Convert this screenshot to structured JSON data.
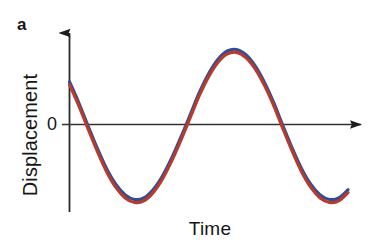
{
  "figure": {
    "panel_label": "a",
    "background_color": "#ffffff",
    "width": 381,
    "height": 248
  },
  "chart_data": {
    "type": "line",
    "title": "",
    "subtitle": "",
    "xlabel": "Time",
    "ylabel": "Displacement",
    "grid": false,
    "legend": null,
    "axes": {
      "x_axis": {
        "label": "Time",
        "tick_labels": [],
        "arrow": true,
        "zero_line": true,
        "color": "#303030"
      },
      "y_axis": {
        "label": "Displacement",
        "tick_labels": [
          "0"
        ],
        "tick_values": [
          0
        ],
        "arrow": true,
        "color": "#303030"
      }
    },
    "xlim": [
      0,
      1.52
    ],
    "ylim": [
      -1.15,
      1.15
    ],
    "annotations": [
      {
        "text": "a",
        "role": "panel-label"
      },
      {
        "text": "0",
        "role": "y-axis-zero-tick"
      }
    ],
    "series": [
      {
        "name": "wave-blue",
        "color": "#2d4f97",
        "line_width": 3.2,
        "amplitude": 1.0,
        "period": 1.0,
        "phase_deg": 145,
        "x": [
          0.0,
          0.05,
          0.1,
          0.15,
          0.2,
          0.25,
          0.3,
          0.35,
          0.4,
          0.45,
          0.5,
          0.55,
          0.6,
          0.65,
          0.7,
          0.75,
          0.8,
          0.85,
          0.9,
          0.95,
          1.0,
          1.05,
          1.1,
          1.15,
          1.2,
          1.25,
          1.3,
          1.35,
          1.4,
          1.45,
          1.5
        ],
        "values": [
          0.57,
          0.29,
          -0.02,
          -0.32,
          -0.59,
          -0.8,
          -0.94,
          -1.0,
          -0.98,
          -0.87,
          -0.69,
          -0.45,
          -0.17,
          0.13,
          0.43,
          0.68,
          0.87,
          0.98,
          1.0,
          0.93,
          0.78,
          0.56,
          0.29,
          -0.02,
          -0.32,
          -0.59,
          -0.8,
          -0.94,
          -1.0,
          -0.98,
          -0.87
        ]
      },
      {
        "name": "wave-red",
        "color": "#b73a2c",
        "line_width": 3.2,
        "amplitude": 1.0,
        "period": 1.0,
        "phase_deg": 145,
        "x": [
          0.0,
          0.05,
          0.1,
          0.15,
          0.2,
          0.25,
          0.3,
          0.35,
          0.4,
          0.45,
          0.5,
          0.55,
          0.6,
          0.65,
          0.7,
          0.75,
          0.8,
          0.85,
          0.9,
          0.95,
          1.0,
          1.05,
          1.1,
          1.15,
          1.2,
          1.25,
          1.3,
          1.35,
          1.4,
          1.45,
          1.5
        ],
        "values": [
          0.55,
          0.27,
          -0.04,
          -0.34,
          -0.61,
          -0.82,
          -0.96,
          -1.02,
          -1.0,
          -0.89,
          -0.71,
          -0.47,
          -0.19,
          0.11,
          0.41,
          0.66,
          0.85,
          0.96,
          0.98,
          0.91,
          0.76,
          0.54,
          0.27,
          -0.04,
          -0.34,
          -0.61,
          -0.82,
          -0.96,
          -1.02,
          -1.0,
          -0.89
        ]
      }
    ]
  }
}
